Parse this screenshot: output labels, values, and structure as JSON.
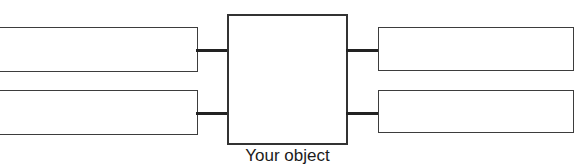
{
  "diagram": {
    "type": "concept-map",
    "title": "",
    "center": {
      "label": "",
      "caption": "Your object"
    },
    "left_nodes": [
      {
        "label": "",
        "position": "top"
      },
      {
        "label": "",
        "position": "bottom"
      }
    ],
    "right_nodes": [
      {
        "label": "",
        "position": "top"
      },
      {
        "label": "",
        "position": "bottom"
      }
    ],
    "connectors": [
      {
        "from": "left-top",
        "to": "center"
      },
      {
        "from": "left-bottom",
        "to": "center"
      },
      {
        "from": "center",
        "to": "right-top"
      },
      {
        "from": "center",
        "to": "right-bottom"
      }
    ],
    "colors": {
      "background": "#ffffff",
      "box_fill": "#ffffff",
      "box_border": "#3d3d3d",
      "center_border": "#333333",
      "connector": "#222222",
      "text": "#1b1b1b"
    }
  }
}
